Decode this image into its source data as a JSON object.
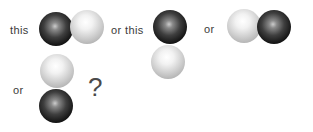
{
  "figure": {
    "background": "#ffffff",
    "text_color": "#3a3a3a",
    "question_mark": "?",
    "options": [
      {
        "label": "this",
        "arrangement": "horizontal",
        "balls": [
          "dark",
          "light"
        ]
      },
      {
        "label": "or this",
        "arrangement": "vertical",
        "balls": [
          "dark",
          "light"
        ]
      },
      {
        "label": "or",
        "arrangement": "horizontal",
        "balls": [
          "light",
          "dark"
        ]
      },
      {
        "label": "or",
        "arrangement": "vertical",
        "balls": [
          "light",
          "dark"
        ]
      }
    ],
    "ball_colors": {
      "dark_edge": "#0a0a0a",
      "dark_highlight": "#cccccc",
      "light_edge": "#9c9c9c",
      "light_highlight": "#ffffff"
    }
  }
}
